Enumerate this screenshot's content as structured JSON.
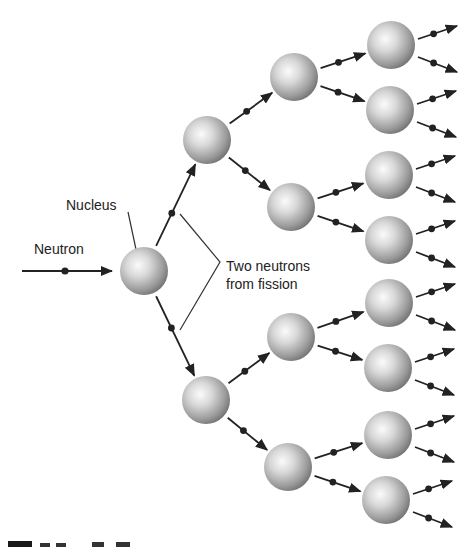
{
  "figure": {
    "labels": {
      "neutron": "Neutron",
      "nucleus": "Nucleus",
      "two_neutrons_line1": "Two neutrons",
      "two_neutrons_line2": "from fission"
    },
    "caption_partial": "Figure 13.5",
    "colors": {
      "arrow": "#222222",
      "sphere_light": "#f4f4f4",
      "sphere_dark": "#6e6e6e",
      "text": "#222222"
    },
    "concept": "Nuclear fission chain reaction: one neutron splits a nucleus releasing two neutrons, each splitting further nuclei",
    "generations": [
      {
        "level": 0,
        "nuclei": [
          [
            144,
            271
          ]
        ]
      },
      {
        "level": 1,
        "nuclei": [
          [
            207,
            140
          ],
          [
            206,
            400
          ]
        ]
      },
      {
        "level": 2,
        "nuclei": [
          [
            294,
            77
          ],
          [
            291,
            207
          ],
          [
            291,
            337
          ],
          [
            288,
            467
          ]
        ]
      },
      {
        "level": 3,
        "nuclei": [
          [
            391,
            45
          ],
          [
            390,
            110
          ],
          [
            389,
            175
          ],
          [
            389,
            240
          ],
          [
            389,
            303
          ],
          [
            388,
            368
          ],
          [
            388,
            435
          ],
          [
            386,
            500
          ]
        ]
      }
    ]
  }
}
